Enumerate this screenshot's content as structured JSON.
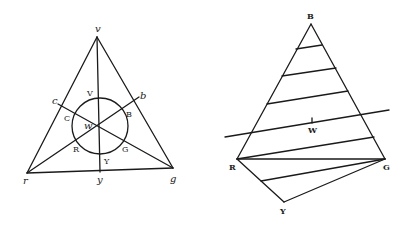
{
  "figure_left": {
    "name": "Color triangle with circle",
    "vertices": {
      "v": {
        "label": "v",
        "x": 97,
        "y": 36
      },
      "r": {
        "label": "r",
        "x": 27,
        "y": 173
      },
      "g": {
        "label": "g",
        "x": 173,
        "y": 168
      }
    },
    "side_points": {
      "c": {
        "label": "c",
        "x": 58,
        "y": 104
      },
      "b": {
        "label": "b",
        "x": 139,
        "y": 97
      },
      "y": {
        "label": "y",
        "x": 100,
        "y": 172
      }
    },
    "center": {
      "label": "w",
      "x": 99,
      "y": 125
    },
    "circle": {
      "cx": 100,
      "cy": 126,
      "r": 27
    },
    "circle_labels": {
      "V": "V",
      "C": "C",
      "B": "B",
      "R": "R",
      "G": "G",
      "Y": "Y"
    }
  },
  "figure_right": {
    "name": "Triangle with parallel lines",
    "vertices": {
      "B": {
        "label": "B",
        "x": 311,
        "y": 22
      },
      "R": {
        "label": "R",
        "x": 237,
        "y": 159
      },
      "G": {
        "label": "G",
        "x": 385,
        "y": 159
      },
      "Y": {
        "label": "Y",
        "x": 284,
        "y": 202
      }
    },
    "center": {
      "label": "W",
      "x": 312,
      "y": 121
    },
    "transversal": {
      "x1": 225,
      "y1": 137,
      "x2": 389,
      "y2": 110
    }
  },
  "colors": {
    "ink": "#1a1a1a",
    "paper": "#ffffff"
  }
}
